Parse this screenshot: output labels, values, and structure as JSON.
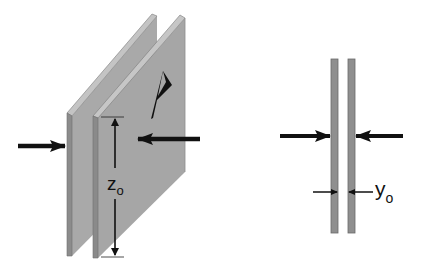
{
  "figure": {
    "left_view": {
      "title": "perspective view of two parallel plates",
      "plate_label": "A",
      "height_label": {
        "main": "z",
        "subscript": "o"
      },
      "arrows": [
        "force-arrow-from-left",
        "force-arrow-from-right"
      ]
    },
    "right_view": {
      "title": "edge-on view of two parallel plates",
      "gap_label": {
        "main": "y",
        "subscript": "o"
      },
      "arrows": [
        "force-arrow-from-left",
        "force-arrow-from-right"
      ]
    }
  },
  "colors": {
    "plate_face": "#a8a8a8",
    "plate_edge": "#8a8a8a",
    "plate_edge_dark": "#6e6e6e",
    "arrow": "#111111",
    "background": "#ffffff"
  }
}
